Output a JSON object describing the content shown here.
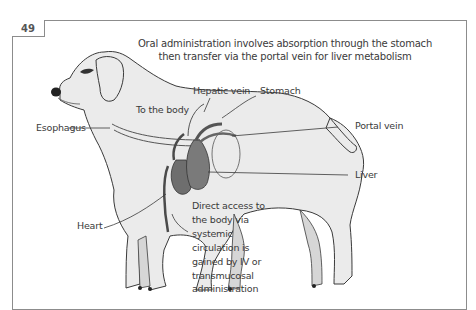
{
  "figure": {
    "number": "49",
    "caption_line1": "Oral administration involves absorption through the stomach",
    "caption_line2": "then transfer via the portal vein for liver metabolism"
  },
  "labels": {
    "hepatic_vein": "Hepatic vein",
    "stomach": "Stomach",
    "to_the_body": "To the body",
    "esophagus": "Esophagus",
    "portal_vein": "Portal vein",
    "liver": "Liver",
    "heart": "Heart"
  },
  "note": {
    "lines": [
      "Direct access to",
      "the body via",
      "systemic",
      "circulation is",
      "gained by IV or",
      "transmucosal",
      "administration"
    ]
  },
  "colors": {
    "body_fill": "#ebebeb",
    "outline": "#3a3a3a",
    "organ_dark": "#6e6e6e",
    "frame": "#8c8c8c"
  }
}
